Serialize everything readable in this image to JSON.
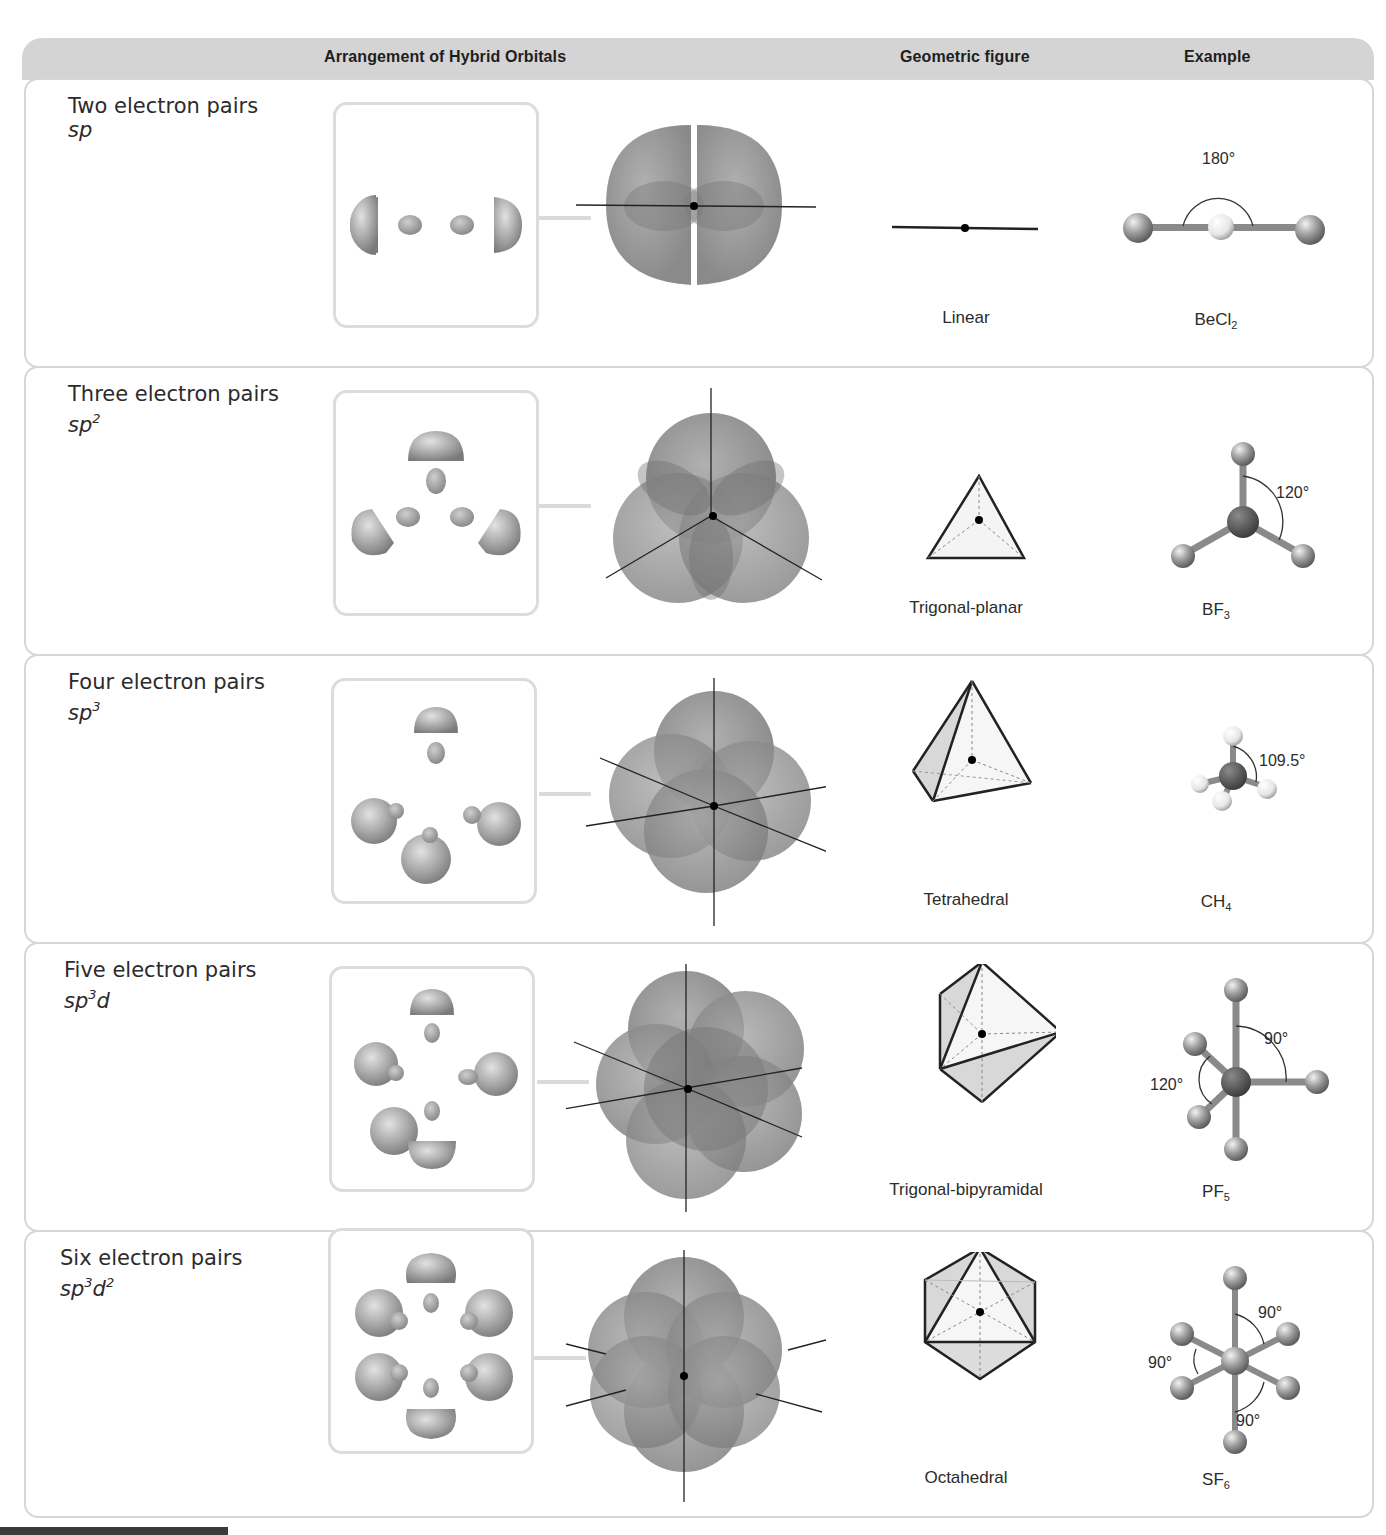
{
  "header": {
    "columns": [
      "Arrangement of Hybrid Orbitals",
      "Geometric figure",
      "Example"
    ]
  },
  "rows": [
    {
      "title": "Two electron pairs",
      "hybrid_base": "sp",
      "hybrid_sup1": "",
      "hybrid_mid": "",
      "hybrid_sup2": "",
      "geometry": "Linear",
      "example_base": "BeCl",
      "example_sub": "2",
      "angles": [
        "180°"
      ]
    },
    {
      "title": "Three electron pairs",
      "hybrid_base": "sp",
      "hybrid_sup1": "2",
      "hybrid_mid": "",
      "hybrid_sup2": "",
      "geometry": "Trigonal-planar",
      "example_base": "BF",
      "example_sub": "3",
      "angles": [
        "120°"
      ]
    },
    {
      "title": "Four electron pairs",
      "hybrid_base": "sp",
      "hybrid_sup1": "3",
      "hybrid_mid": "",
      "hybrid_sup2": "",
      "geometry": "Tetrahedral",
      "example_base": "CH",
      "example_sub": "4",
      "angles": [
        "109.5°"
      ]
    },
    {
      "title": "Five electron pairs",
      "hybrid_base": "sp",
      "hybrid_sup1": "3",
      "hybrid_mid": "d",
      "hybrid_sup2": "",
      "geometry": "Trigonal-bipyramidal",
      "example_base": "PF",
      "example_sub": "5",
      "angles": [
        "90°",
        "120°"
      ]
    },
    {
      "title": "Six electron pairs",
      "hybrid_base": "sp",
      "hybrid_sup1": "3",
      "hybrid_mid": "d",
      "hybrid_sup2": "2",
      "geometry": "Octahedral",
      "example_base": "SF",
      "example_sub": "6",
      "angles": [
        "90°",
        "90°",
        "90°"
      ]
    }
  ],
  "colors": {
    "header_bg": "#d4d4d4",
    "row_border": "#d6d6d6",
    "orbital_gray": "#8c8c8c",
    "text": "#2b2b2b"
  }
}
